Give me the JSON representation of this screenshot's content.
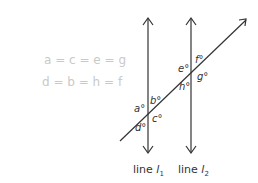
{
  "handwritten_notes": {
    "line1": "a = c = e = g",
    "line2": "d = b = h = f"
  },
  "angles": {
    "a": "a°",
    "b": "b°",
    "c": "c°",
    "d": "d°",
    "e": "e°",
    "f": "f°",
    "g": "g°",
    "h": "h°"
  },
  "labels": {
    "line1_text": "line ",
    "line1_var": "l",
    "line1_sub": "1",
    "line2_text": "line ",
    "line2_var": "l",
    "line2_sub": "2"
  },
  "colors": {
    "lines": "#333333",
    "handwriting": "#c9c9c9"
  }
}
